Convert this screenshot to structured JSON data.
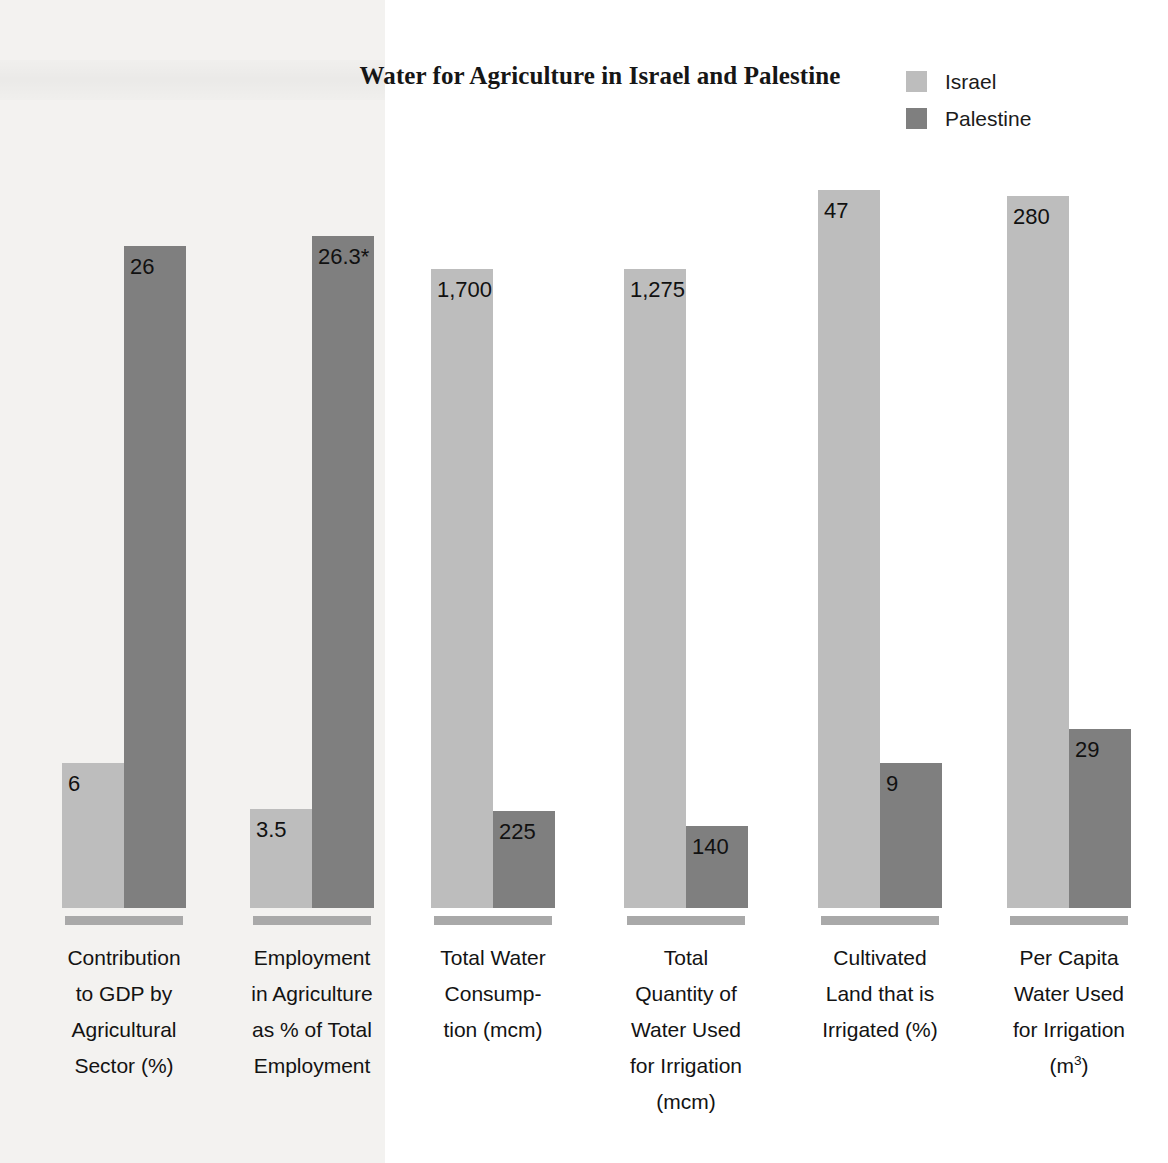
{
  "title": "Water for Agriculture in Israel and Palestine",
  "legend": {
    "position": "top-right",
    "items": [
      {
        "label": "Israel",
        "color": "#bdbdbd",
        "swatch_name": "legend-swatch-israel"
      },
      {
        "label": "Palestine",
        "color": "#7f7f7f",
        "swatch_name": "legend-swatch-palestine"
      }
    ]
  },
  "chart_data": {
    "type": "bar",
    "title": "Water for Agriculture in Israel and Palestine",
    "xlabel": "",
    "ylabel": "",
    "grid": false,
    "legend_position": "top-right",
    "note": "Each category uses its own independent vertical scale; no y-axis is drawn.",
    "categories": [
      "Contribution to GDP by Agricultural Sector (%)",
      "Employment in Agriculture as % of Total Employment",
      "Total Water Consumption (mcm)",
      "Total Quantity of Water Used for Irrigation (mcm)",
      "Cultivated Land that is Irrigated (%)",
      "Per Capita Water Used for Irrigation (m3)"
    ],
    "series": [
      {
        "name": "Israel",
        "color": "#bdbdbd",
        "values": [
          6,
          3.5,
          1700,
          1275,
          47,
          280
        ],
        "value_labels": [
          "6",
          "3.5",
          "1,700",
          "1,275",
          "47",
          "280"
        ]
      },
      {
        "name": "Palestine",
        "color": "#7f7f7f",
        "values": [
          26,
          26.3,
          225,
          140,
          9,
          29
        ],
        "value_labels": [
          "26",
          "26.3*",
          "225",
          "140",
          "9",
          "29"
        ]
      }
    ],
    "footnote_marker": "*"
  },
  "groups": [
    {
      "id": "gdp-contribution",
      "label_lines": [
        "Contribution",
        "to GDP by",
        "Agricultural",
        "Sector (%)"
      ],
      "israel": {
        "value": 6,
        "label": "6"
      },
      "palestine": {
        "value": 26,
        "label": "26"
      }
    },
    {
      "id": "agriculture-employment",
      "label_lines": [
        "Employment",
        "in Agriculture",
        "as % of Total",
        "Employment"
      ],
      "israel": {
        "value": 3.5,
        "label": "3.5"
      },
      "palestine": {
        "value": 26.3,
        "label": "26.3*"
      }
    },
    {
      "id": "total-water-consumption",
      "label_lines": [
        "Total Water",
        "Consump-",
        "tion (mcm)"
      ],
      "israel": {
        "value": 1700,
        "label": "1,700"
      },
      "palestine": {
        "value": 225,
        "label": "225"
      }
    },
    {
      "id": "water-used-irrigation",
      "label_lines": [
        "Total",
        "Quantity of",
        "Water Used",
        "for Irrigation",
        "(mcm)"
      ],
      "israel": {
        "value": 1275,
        "label": "1,275"
      },
      "palestine": {
        "value": 140,
        "label": "140"
      }
    },
    {
      "id": "cultivated-land-irrigated",
      "label_lines": [
        "Cultivated",
        "Land that is",
        "Irrigated (%)"
      ],
      "israel": {
        "value": 47,
        "label": "47"
      },
      "palestine": {
        "value": 9,
        "label": "9"
      }
    },
    {
      "id": "per-capita-water-irrigation",
      "label_lines": [
        "Per Capita",
        "Water Used",
        "for Irrigation",
        "(m3)"
      ],
      "israel": {
        "value": 280,
        "label": "280"
      },
      "palestine": {
        "value": 29,
        "label": "29"
      }
    }
  ]
}
